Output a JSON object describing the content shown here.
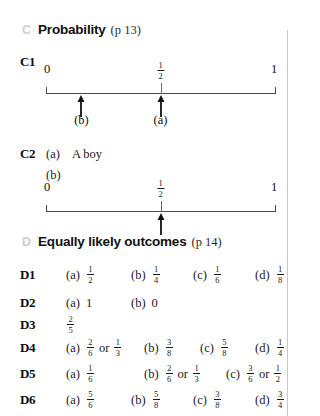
{
  "page": {
    "background": "#ffffff",
    "rule_color": "#c9c9c9"
  },
  "sections": [
    {
      "letter": "C",
      "title": "Probability",
      "page_ref": "(p 13)"
    },
    {
      "letter": "D",
      "title": "Equally likely outcomes",
      "page_ref": "(p 14)"
    }
  ],
  "numberlines": [
    {
      "id": "c1-numberline",
      "left_label": "0",
      "mid_label_num": "1",
      "mid_label_den": "2",
      "right_label": "1",
      "arrows": [
        {
          "caption": "(b)",
          "position": 0.155
        },
        {
          "caption": "(a)",
          "position": 0.5
        }
      ]
    },
    {
      "id": "c2-numberline",
      "left_label": "0",
      "mid_label_num": "1",
      "mid_label_den": "2",
      "right_label": "1",
      "arrows": [
        {
          "caption": "",
          "position": 0.5
        }
      ]
    }
  ],
  "questions": {
    "c1": {
      "label": "C1"
    },
    "c2": {
      "label": "C2",
      "part_a_tag": "(a)",
      "part_a_value": "A boy",
      "part_b_tag": "(b)"
    },
    "d1": {
      "label": "D1",
      "parts": [
        {
          "tag": "(a)",
          "num": "1",
          "den": "2"
        },
        {
          "tag": "(b)",
          "num": "1",
          "den": "4"
        },
        {
          "tag": "(c)",
          "num": "1",
          "den": "6"
        },
        {
          "tag": "(d)",
          "num": "1",
          "den": "8"
        }
      ]
    },
    "d2": {
      "label": "D2",
      "parts": [
        {
          "tag": "(a)",
          "value": "1"
        },
        {
          "tag": "(b)",
          "value": "0"
        }
      ]
    },
    "d3": {
      "label": "D3",
      "num": "2",
      "den": "5"
    },
    "d4": {
      "label": "D4",
      "parts": [
        {
          "tag": "(a)",
          "num": "2",
          "den": "6",
          "conj": "or",
          "num2": "1",
          "den2": "3"
        },
        {
          "tag": "(b)",
          "num": "3",
          "den": "8"
        },
        {
          "tag": "(c)",
          "num": "5",
          "den": "8"
        },
        {
          "tag": "(d)",
          "num": "1",
          "den": "4"
        }
      ]
    },
    "d5": {
      "label": "D5",
      "parts": [
        {
          "tag": "(a)",
          "num": "1",
          "den": "6"
        },
        {
          "tag": "(b)",
          "num": "2",
          "den": "6",
          "conj": "or",
          "num2": "1",
          "den2": "3"
        },
        {
          "tag": "(c)",
          "num": "3",
          "den": "6",
          "conj": "or",
          "num2": "1",
          "den2": "2"
        }
      ]
    },
    "d6": {
      "label": "D6",
      "parts": [
        {
          "tag": "(a)",
          "num": "5",
          "den": "6"
        },
        {
          "tag": "(b)",
          "num": "5",
          "den": "8"
        },
        {
          "tag": "(c)",
          "num": "3",
          "den": "8"
        },
        {
          "tag": "(d)",
          "num": "3",
          "den": "4"
        }
      ]
    }
  }
}
